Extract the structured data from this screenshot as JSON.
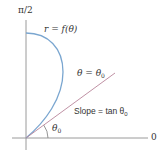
{
  "diagram": {
    "type": "polar-tangent-illustration",
    "axis_labels": {
      "vertical": "π/2",
      "horizontal": "0"
    },
    "curve": {
      "label": "r = f(θ)",
      "color": "#7aa6d0"
    },
    "ray": {
      "label_lhs": "θ = θ",
      "label_rhs_sub": "0",
      "color": "#b8859a"
    },
    "slope": {
      "label": "Slope = tan θ",
      "label_sub": "0"
    },
    "angle": {
      "label": "θ",
      "label_sub": "0"
    },
    "colors": {
      "axis": "#9a9a9a",
      "text": "#333333",
      "curve": "#7aa6d0",
      "ray": "#b8859a"
    }
  }
}
